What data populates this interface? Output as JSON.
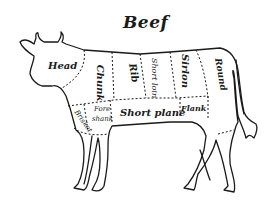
{
  "title": "Beef",
  "cuts": [
    {
      "id": "head",
      "label": "Head"
    },
    {
      "id": "chuck",
      "label": "Chunk"
    },
    {
      "id": "rib",
      "label": "Rib"
    },
    {
      "id": "short-loin",
      "label": "Short loin"
    },
    {
      "id": "sirloin",
      "label": "Sirlon"
    },
    {
      "id": "round",
      "label": "Round"
    },
    {
      "id": "brisket",
      "label": "Brisket"
    },
    {
      "id": "fore-shank",
      "label_line1": "Fore",
      "label_line2": "shank"
    },
    {
      "id": "short-plate",
      "label": "Short plane"
    },
    {
      "id": "flank",
      "label": "Flank"
    }
  ],
  "colors": {
    "outline": "#1a1a1a",
    "background": "#ffffff"
  }
}
